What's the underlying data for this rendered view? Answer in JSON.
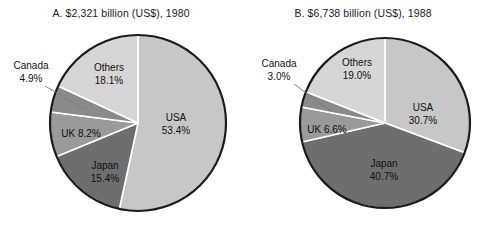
{
  "figure": {
    "background_color": "#ffffff",
    "width": 484,
    "height": 243
  },
  "palette": {
    "usa": "#c7c7c7",
    "japan": "#6e6e6e",
    "uk": "#9a9a9a",
    "canada": "#8a8a8a",
    "others": "#d6d6d6",
    "outline": "#1a1a1a",
    "separator": "#ffffff",
    "leader_line": "#7a7a7a",
    "text": "#111111"
  },
  "charts": [
    {
      "id": "chart-a",
      "title": "A. $2,321 billion (US$), 1980",
      "labels": {
        "usa_name": "USA",
        "usa_value": "53.4%",
        "japan_name": "Japan",
        "japan_value": "15.4%",
        "uk_combined": "UK 8.2%",
        "canada_name": "Canada",
        "canada_value": "4.9%",
        "others_name": "Others",
        "others_value": "18.1%"
      }
    },
    {
      "id": "chart-b",
      "title": "B. $6,738 billion (US$), 1988",
      "labels": {
        "usa_name": "USA",
        "usa_value": "30.7%",
        "japan_name": "Japan",
        "japan_value": "40.7%",
        "uk_combined": "UK 6.6%",
        "canada_name": "Canada",
        "canada_value": "3.0%",
        "others_name": "Others",
        "others_value": "19.0%"
      }
    }
  ],
  "chart_data": [
    {
      "type": "pie",
      "id": "chart-a",
      "title": "A. $2,321 billion (US$), 1980",
      "total_label": "$2,321 billion (US$)",
      "year": 1980,
      "units": "percent of total",
      "start_angle_deg": 0,
      "direction": "clockwise",
      "categories": [
        "USA",
        "Japan",
        "UK",
        "Canada",
        "Others"
      ],
      "values": [
        53.4,
        15.4,
        8.2,
        4.9,
        18.1
      ],
      "colors": [
        "#c7c7c7",
        "#6e6e6e",
        "#9a9a9a",
        "#8a8a8a",
        "#d6d6d6"
      ],
      "labels": [
        "USA 53.4%",
        "Japan 15.4%",
        "UK 8.2%",
        "Canada 4.9%",
        "Others 18.1%"
      ],
      "callout_slices": [
        "Canada"
      ],
      "legend": "none",
      "grid": false
    },
    {
      "type": "pie",
      "id": "chart-b",
      "title": "B. $6,738 billion (US$), 1988",
      "total_label": "$6,738 billion (US$)",
      "year": 1988,
      "units": "percent of total",
      "start_angle_deg": 0,
      "direction": "clockwise",
      "categories": [
        "USA",
        "Japan",
        "UK",
        "Canada",
        "Others"
      ],
      "values": [
        30.7,
        40.7,
        6.6,
        3.0,
        19.0
      ],
      "colors": [
        "#c7c7c7",
        "#6e6e6e",
        "#9a9a9a",
        "#8a8a8a",
        "#d6d6d6"
      ],
      "labels": [
        "USA 30.7%",
        "Japan 40.7%",
        "UK 6.6%",
        "Canada 3.0%",
        "Others 19.0%"
      ],
      "callout_slices": [
        "Canada"
      ],
      "legend": "none",
      "grid": false
    }
  ]
}
